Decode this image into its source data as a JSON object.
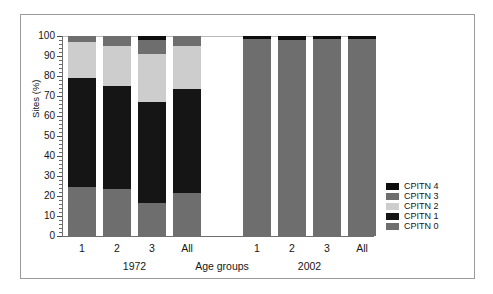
{
  "chart_data": {
    "type": "bar",
    "subtype": "stacked-percent",
    "title": "",
    "xlabel": "Age groups",
    "ylabel": "Sites (%)",
    "ylim": [
      0,
      100
    ],
    "ytick_step": 10,
    "yminor_step": 2,
    "grid": false,
    "legend_position": "right",
    "ytick_labels": [
      "100",
      "90",
      "80",
      "70",
      "60",
      "50",
      "40",
      "30",
      "20",
      "10",
      "0"
    ],
    "group_labels": [
      "1972",
      "2002"
    ],
    "categories": [
      "1",
      "2",
      "3",
      "All",
      "1",
      "2",
      "3",
      "All"
    ],
    "series": [
      {
        "name": "CPITN 0",
        "color": "#6e6e6e",
        "values": [
          24.5,
          23.5,
          16.5,
          21.5,
          98.5,
          98.0,
          98.5,
          98.5
        ]
      },
      {
        "name": "CPITN 1",
        "color": "#151515",
        "values": [
          54.5,
          51.5,
          50.5,
          52.0,
          0.0,
          0.0,
          0.0,
          0.0
        ]
      },
      {
        "name": "CPITN 2",
        "color": "#cdcdcd",
        "values": [
          18.0,
          20.0,
          24.0,
          21.5,
          0.0,
          0.0,
          0.0,
          0.0
        ]
      },
      {
        "name": "CPITN 3",
        "color": "#6e6e6e",
        "values": [
          3.0,
          5.0,
          7.0,
          5.0,
          0.0,
          0.0,
          0.0,
          0.0
        ]
      },
      {
        "name": "CPITN 4",
        "color": "#0d0d0d",
        "values": [
          0.0,
          0.0,
          2.0,
          0.0,
          1.5,
          2.0,
          1.5,
          1.5
        ]
      }
    ],
    "legend_entries": [
      {
        "label": "CPITN 4",
        "color": "#0d0d0d"
      },
      {
        "label": "CPITN 3",
        "color": "#6e6e6e"
      },
      {
        "label": "CPITN 2",
        "color": "#cdcdcd"
      },
      {
        "label": "CPITN 1",
        "color": "#151515"
      },
      {
        "label": "CPITN 0",
        "color": "#6e6e6e"
      }
    ]
  },
  "figure": {
    "frame_color": "#9a9a9a",
    "background": "#ffffff"
  }
}
